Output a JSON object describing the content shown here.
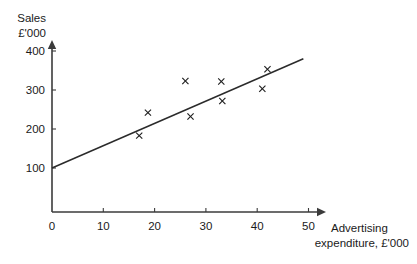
{
  "chart_data": {
    "type": "scatter",
    "title": "",
    "subtitle": "",
    "xlabel": "Advertising expenditure, £'000",
    "xlabel_line1": "Advertising",
    "xlabel_line2": "expenditure, £'000",
    "ylabel": "Sales £'000",
    "ylabel_line1": "Sales",
    "ylabel_line2": "£'000",
    "xlim": [
      0,
      52
    ],
    "ylim": [
      0,
      430
    ],
    "xticks": [
      0,
      10,
      20,
      30,
      40,
      50
    ],
    "xtick_labels": [
      "0",
      "10",
      "20",
      "30",
      "40",
      "50"
    ],
    "yticks": [
      100,
      200,
      300,
      400
    ],
    "ytick_labels": [
      "100",
      "200",
      "300",
      "400"
    ],
    "origin_label": "0",
    "grid": false,
    "legend": false,
    "marker_symbol": "x",
    "points": [
      {
        "x": 17.0,
        "y": 183
      },
      {
        "x": 18.7,
        "y": 242
      },
      {
        "x": 26.0,
        "y": 323
      },
      {
        "x": 27.0,
        "y": 232
      },
      {
        "x": 33.0,
        "y": 322
      },
      {
        "x": 33.2,
        "y": 272
      },
      {
        "x": 41.0,
        "y": 303
      },
      {
        "x": 42.0,
        "y": 353
      }
    ],
    "trend_line": {
      "type": "line-of-best-fit",
      "x_start": 0,
      "y_start": 100,
      "x_end": 49,
      "y_end": 380
    },
    "colors": {
      "axis": "#3b3b3b",
      "marker": "#1d1d1d",
      "trend": "#2b2b2b",
      "background": "#ffffff"
    }
  }
}
